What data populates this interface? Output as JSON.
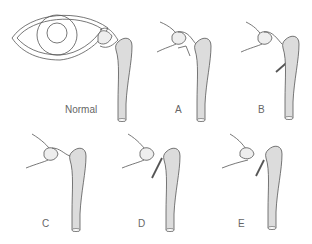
{
  "diagram": {
    "type": "lacrimal-drainage-variants",
    "panels": [
      {
        "id": "normal",
        "label": "Normal"
      },
      {
        "id": "a",
        "label": "A"
      },
      {
        "id": "b",
        "label": "B"
      },
      {
        "id": "c",
        "label": "C"
      },
      {
        "id": "d",
        "label": "D"
      },
      {
        "id": "e",
        "label": "E"
      }
    ],
    "colors": {
      "stroke": "#555555",
      "sac_fill": "#dcdcdc",
      "label": "#666666"
    }
  }
}
